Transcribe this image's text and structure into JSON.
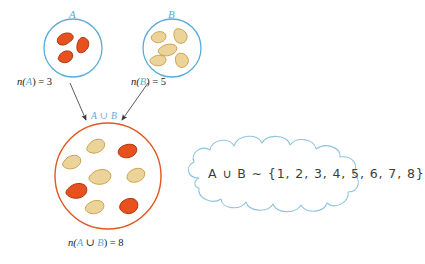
{
  "figure": {
    "colors": {
      "set_circle_stroke": "#5aacd6",
      "union_circle_stroke": "#e25822",
      "bean_orange_fill": "#e8501e",
      "bean_orange_stroke": "#a8330d",
      "bean_tan_fill": "#ecd39a",
      "bean_tan_stroke": "#c9a24a",
      "arrow_stroke": "#555555",
      "cloud_stroke": "#8fc4de",
      "text": "#1a1a1a",
      "blue_label": "#5aacd6"
    },
    "set_a": {
      "letter": "A",
      "count_label_prefix": "n(",
      "count_label_symbol": "A",
      "count_label_suffix": ") = 3",
      "count": 3,
      "bean_color": "orange"
    },
    "set_b": {
      "letter": "B",
      "count_label_prefix": "n(",
      "count_label_symbol": "B",
      "count_label_suffix": ") = 5",
      "count": 5,
      "bean_color": "tan"
    },
    "union": {
      "top_label": "A ∪ B",
      "count_label_prefix": "n(",
      "count_label_symbol_a": "A",
      "count_label_union": " ∪ ",
      "count_label_symbol_b": "B",
      "count_label_suffix": ") = 8",
      "count": 8,
      "orange_beans": 3,
      "tan_beans": 5
    },
    "cloud": {
      "text": "A ∪ B ∼ {1, 2, 3, 4, 5, 6, 7, 8}"
    }
  }
}
